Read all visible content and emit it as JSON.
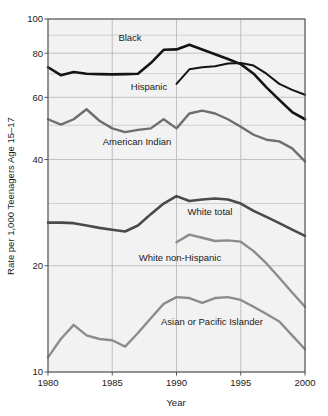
{
  "chart_data": {
    "type": "line",
    "title": "",
    "xlabel": "Year",
    "ylabel": "Rate per 1,000 Teenagers Age 15–17",
    "xlim": [
      1980,
      2000
    ],
    "ylim": [
      10,
      100
    ],
    "yscale": "log",
    "grid": true,
    "legend_position": "inline-annotations",
    "x": [
      1980,
      1981,
      1982,
      1983,
      1984,
      1985,
      1986,
      1987,
      1988,
      1989,
      1990,
      1991,
      1992,
      1993,
      1994,
      1995,
      1996,
      1997,
      1998,
      1999,
      2000
    ],
    "xticks": [
      "1980",
      "1985",
      "1990",
      "1995",
      "2000"
    ],
    "yticks": [
      "100",
      "80",
      "60",
      "40",
      "20",
      "10"
    ],
    "series": [
      {
        "name": "Black",
        "color": "#141414",
        "width": 2.6,
        "x": [
          1980,
          1981,
          1982,
          1983,
          1984,
          1985,
          1986,
          1987,
          1988,
          1989,
          1990,
          1991,
          1992,
          1993,
          1994,
          1995,
          1996,
          1997,
          1998,
          1999,
          2000
        ],
        "values": [
          73.0,
          69.3,
          70.8,
          70.0,
          69.8,
          69.7,
          69.8,
          70.0,
          75.0,
          81.8,
          82.0,
          84.5,
          82.0,
          79.5,
          77.0,
          74.5,
          70.0,
          64.0,
          59.0,
          54.5,
          52.0
        ]
      },
      {
        "name": "Hispanic",
        "color": "#141414",
        "width": 2.0,
        "x": [
          1990,
          1991,
          1992,
          1993,
          1994,
          1995,
          1996,
          1997,
          1998,
          1999,
          2000
        ],
        "values": [
          65.5,
          72.0,
          73.0,
          73.5,
          74.8,
          75.0,
          73.8,
          70.0,
          65.5,
          63.0,
          61.0
        ]
      },
      {
        "name": "American Indian",
        "color": "#6e6e6e",
        "width": 2.4,
        "x": [
          1980,
          1981,
          1982,
          1983,
          1984,
          1985,
          1986,
          1987,
          1988,
          1989,
          1990,
          1991,
          1992,
          1993,
          1994,
          1995,
          1996,
          1997,
          1998,
          1999,
          2000
        ],
        "values": [
          52.0,
          50.2,
          52.0,
          55.5,
          51.5,
          49.0,
          47.8,
          48.5,
          49.0,
          52.0,
          49.0,
          54.0,
          55.0,
          54.0,
          52.0,
          49.5,
          47.0,
          45.5,
          45.0,
          43.0,
          39.5
        ]
      },
      {
        "name": "White total",
        "color": "#4a4a4a",
        "width": 2.6,
        "x": [
          1980,
          1981,
          1982,
          1983,
          1984,
          1985,
          1986,
          1987,
          1988,
          1989,
          1990,
          1991,
          1992,
          1993,
          1994,
          1995,
          1996,
          1997,
          1998,
          1999,
          2000
        ],
        "values": [
          26.5,
          26.5,
          26.4,
          26.0,
          25.6,
          25.3,
          25.0,
          26.0,
          28.0,
          30.0,
          31.5,
          30.5,
          30.8,
          31.0,
          30.8,
          30.0,
          28.6,
          27.5,
          26.4,
          25.3,
          24.3
        ]
      },
      {
        "name": "White non-Hispanic",
        "color": "#8c8c8c",
        "width": 2.4,
        "x": [
          1990,
          1991,
          1992,
          1993,
          1994,
          1995,
          1996,
          1997,
          1998,
          1999,
          2000
        ],
        "values": [
          23.3,
          24.5,
          24.0,
          23.5,
          23.6,
          23.4,
          22.0,
          20.3,
          18.5,
          16.8,
          15.3
        ]
      },
      {
        "name": "Asian or Pacific Islander",
        "color": "#8c8c8c",
        "width": 2.4,
        "x": [
          1980,
          1981,
          1982,
          1983,
          1984,
          1985,
          1986,
          1987,
          1988,
          1989,
          1990,
          1991,
          1992,
          1993,
          1994,
          1995,
          1996,
          1997,
          1998,
          1999,
          2000
        ],
        "values": [
          11.0,
          12.4,
          13.6,
          12.7,
          12.4,
          12.3,
          11.8,
          12.9,
          14.2,
          15.6,
          16.3,
          16.2,
          15.7,
          16.2,
          16.3,
          16.0,
          15.3,
          14.6,
          13.9,
          12.7,
          11.6
        ]
      }
    ],
    "annotations": [
      {
        "text": "Black",
        "x_px": 130,
        "y_px": 41
      },
      {
        "text": "Hispanic",
        "x_px": 149,
        "y_px": 90
      },
      {
        "text": "American Indian",
        "x_px": 137,
        "y_px": 145
      },
      {
        "text": "White total",
        "x_px": 210,
        "y_px": 215
      },
      {
        "text": "White non-Hispanic",
        "x_px": 180,
        "y_px": 261
      },
      {
        "text": "Asian or Pacific Islander",
        "x_px": 212,
        "y_px": 325
      }
    ]
  },
  "axes": {
    "y_axis_title": "Rate per 1,000 Teenagers Age 15–17",
    "x_axis_title": "Year",
    "y_tick_labels": [
      "100",
      "80",
      "60",
      "40",
      "20",
      "10"
    ],
    "x_tick_labels": [
      "1980",
      "1985",
      "1990",
      "1995",
      "2000"
    ]
  },
  "colors": {
    "plot_background": "#f2f2f2",
    "grid": "#b8b8b8",
    "frame": "#555555",
    "text": "#1a1a1a",
    "page_background": "#ffffff"
  }
}
